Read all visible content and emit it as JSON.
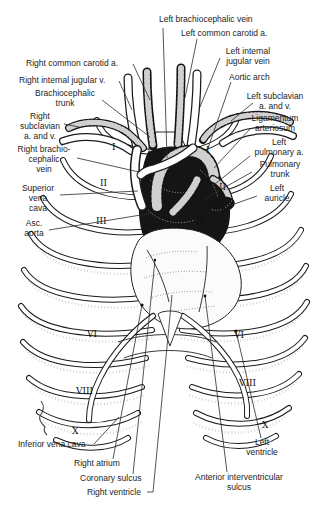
{
  "illustration": {
    "title": "Thorax with heart and great vessels (anterior view)",
    "colors": {
      "ink": "#1b1b1b",
      "paper": "#ffffff"
    },
    "labels": [
      {
        "id": "left-brachiocephalic-vein",
        "text": "Left brachiocephalic vein"
      },
      {
        "id": "left-common-carotid-a",
        "text": "Left common carotid a."
      },
      {
        "id": "left-internal-jugular-vein",
        "text": "Left internal\njugular vein"
      },
      {
        "id": "aortic-arch",
        "text": "Aortic arch"
      },
      {
        "id": "right-common-carotid-a",
        "text": "Right common carotid a."
      },
      {
        "id": "right-internal-jugular-v",
        "text": "Right internal jugular v."
      },
      {
        "id": "brachiocephalic-trunk",
        "text": "Brachiocephalic\ntrunk"
      },
      {
        "id": "right-subclavian-a-and-v",
        "text": "Right\nsubclavian\na. and v."
      },
      {
        "id": "left-subclavian-a-and-v",
        "text": "Left subclavian\na. and v."
      },
      {
        "id": "ligamentum-arteriosum",
        "text": "Ligamentum\narteriosum"
      },
      {
        "id": "right-brachiocephalic-vein",
        "text": "Right brachio-\ncephalic\nvein"
      },
      {
        "id": "left-pulmonary-a",
        "text": "Left\npulmonary a."
      },
      {
        "id": "pulmonary-trunk",
        "text": "Pulmonary\ntrunk"
      },
      {
        "id": "superior-vena-cava",
        "text": "Superior\nvena\ncava"
      },
      {
        "id": "left-auricle",
        "text": "Left\nauricle"
      },
      {
        "id": "asc-aorta",
        "text": "Asc.\naorta"
      },
      {
        "id": "inferior-vena-cava",
        "text": "Inferior vena cava"
      },
      {
        "id": "right-atrium",
        "text": "Right atrium"
      },
      {
        "id": "coronary-sulcus",
        "text": "Coronary sulcus"
      },
      {
        "id": "right-ventricle",
        "text": "Right ventricle"
      },
      {
        "id": "anterior-interventricular-sulcus",
        "text": "Anterior interventricular\nsulcus"
      },
      {
        "id": "left-ventricle",
        "text": "Left\nventricle"
      }
    ],
    "rib_numerals": [
      {
        "side": "left",
        "value": "I"
      },
      {
        "side": "left",
        "value": "II"
      },
      {
        "side": "left",
        "value": "III"
      },
      {
        "side": "left",
        "value": "VI"
      },
      {
        "side": "left",
        "value": "VIII"
      },
      {
        "side": "left",
        "value": "X"
      },
      {
        "side": "right",
        "value": "I"
      },
      {
        "side": "right",
        "value": "II"
      },
      {
        "side": "right",
        "value": "III"
      },
      {
        "side": "right",
        "value": "VI"
      },
      {
        "side": "right",
        "value": "VIII"
      },
      {
        "side": "right",
        "value": "X"
      }
    ]
  }
}
